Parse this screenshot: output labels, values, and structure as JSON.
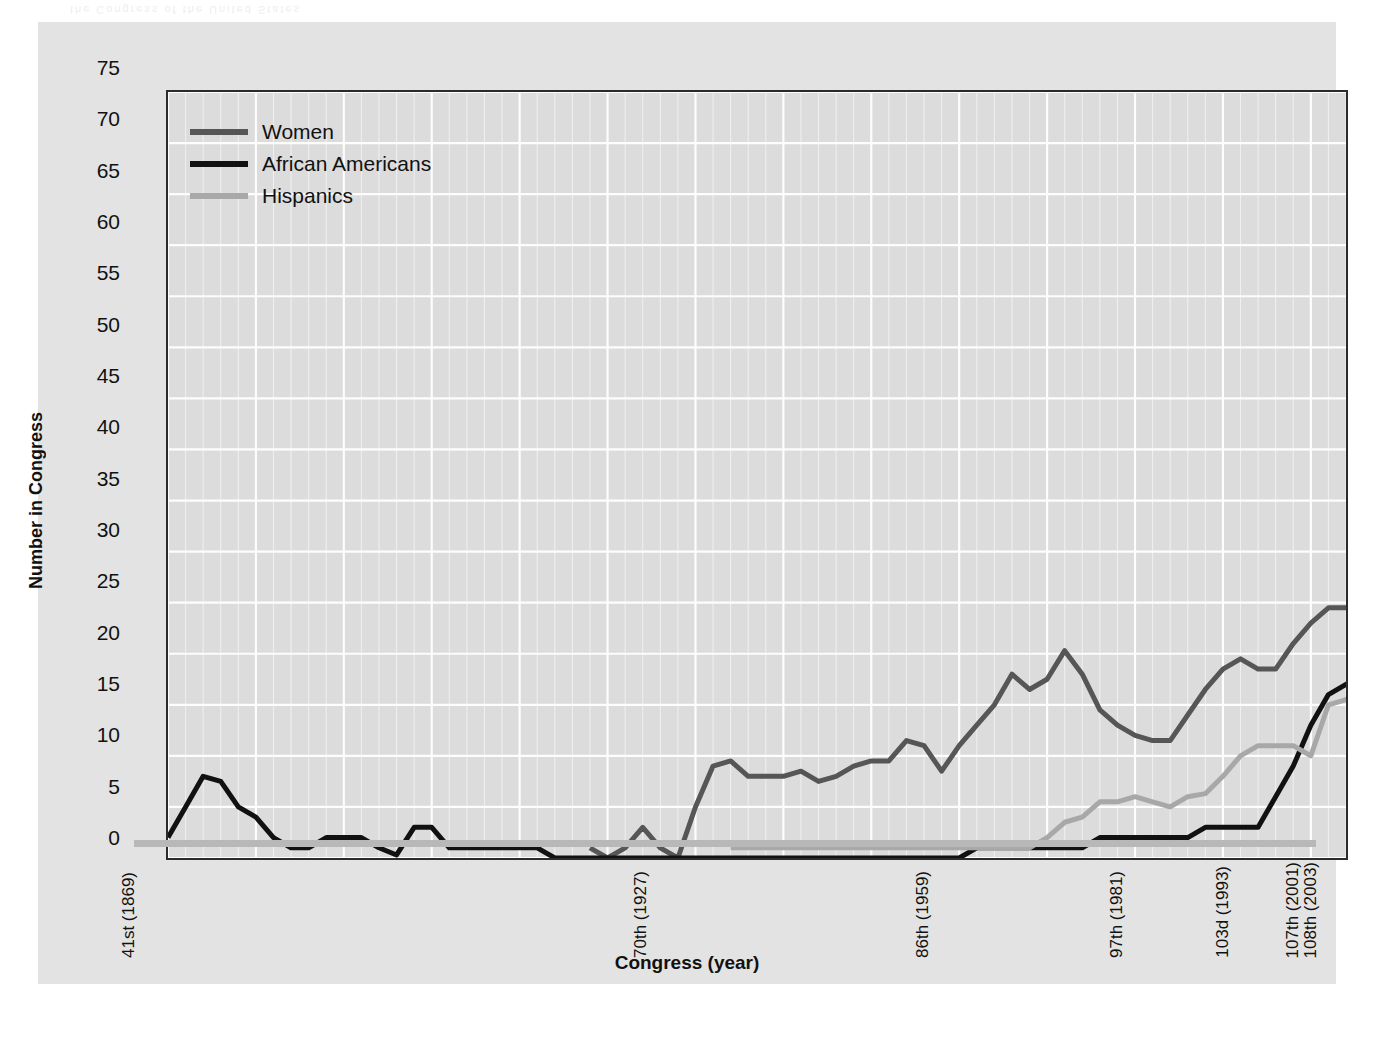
{
  "figure": {
    "bleed_text": "the Congress of the United States",
    "background": "#e3e3e3",
    "plot_background": "#dcdcdc"
  },
  "chart_data": {
    "type": "line",
    "title": "",
    "xlabel": "Congress (year)",
    "ylabel": "Number in Congress",
    "ylim": [
      0,
      75
    ],
    "ytick_step": 5,
    "yticks": [
      0,
      5,
      10,
      15,
      20,
      25,
      30,
      35,
      40,
      45,
      50,
      55,
      60,
      65,
      70,
      75
    ],
    "grid": true,
    "grid_color": "#ffffff",
    "legend_position": "top-left",
    "x_unit": "Congress",
    "x_start_congress": 41,
    "x_end_congress": 108,
    "xticks": [
      {
        "congress": 41,
        "label": "41st (1869)"
      },
      {
        "congress": 70,
        "label": "70th (1927)"
      },
      {
        "congress": 86,
        "label": "86th (1959)"
      },
      {
        "congress": 97,
        "label": "97th (1981)"
      },
      {
        "congress": 103,
        "label": "103d (1993)"
      },
      {
        "congress": 107,
        "label": "107th (2001)"
      },
      {
        "congress": 108,
        "label": "108th (2003)"
      }
    ],
    "series": [
      {
        "name": "Women",
        "color": "#565656",
        "start_congress": 65,
        "values": [
          1,
          0,
          1,
          3,
          1,
          0,
          5,
          9,
          9.5,
          8,
          8,
          8,
          8.5,
          7.5,
          8,
          9,
          9.5,
          9.5,
          11.5,
          11,
          8.5,
          11,
          13,
          15,
          18,
          16.5,
          17.5,
          20.3,
          18,
          14.5,
          13,
          12,
          11.5,
          11.5,
          14,
          16.5,
          18.5,
          19.5,
          18.5,
          18.5,
          21,
          23,
          24.5,
          24.5,
          25.5,
          31,
          54.5,
          56,
          58.5,
          63.5,
          66,
          71,
          72
        ]
      },
      {
        "name": "African Americans",
        "color": "#111111",
        "start_congress": 41,
        "values": [
          2,
          5,
          8,
          7.5,
          5,
          4,
          2,
          1,
          1,
          2,
          2,
          2,
          1,
          0.3,
          3,
          3,
          1,
          1,
          1,
          1,
          1,
          1,
          0,
          0,
          0,
          0,
          0,
          0,
          0,
          0,
          0,
          0,
          0,
          0,
          0,
          0,
          0,
          0,
          0,
          0,
          0,
          0,
          0,
          0,
          0,
          0,
          1,
          1,
          1,
          1,
          1,
          1,
          1,
          2,
          2,
          2,
          2,
          2,
          2,
          3,
          3,
          3,
          3,
          6,
          9,
          13,
          16,
          17,
          18,
          16.5,
          15.5,
          17,
          20,
          20,
          21.5,
          23,
          25.5,
          26,
          40,
          37,
          38.5,
          37,
          37
        ]
      },
      {
        "name": "Hispanics",
        "color": "#a8a8a8",
        "start_congress": 73,
        "values": [
          1,
          1,
          1,
          1,
          1,
          1,
          1,
          1,
          1,
          1,
          1,
          1,
          1,
          1,
          1,
          1,
          1,
          1,
          2,
          3.5,
          4,
          5.5,
          5.5,
          6,
          5.5,
          5,
          6,
          6.3,
          8,
          10,
          11,
          11,
          11,
          10,
          15,
          15.5,
          17,
          17.5,
          19,
          20.5,
          21.5
        ]
      }
    ]
  },
  "legend": {
    "items": [
      {
        "label": "Women",
        "color": "#565656"
      },
      {
        "label": "African Americans",
        "color": "#111111"
      },
      {
        "label": "Hispanics",
        "color": "#a8a8a8"
      }
    ]
  }
}
